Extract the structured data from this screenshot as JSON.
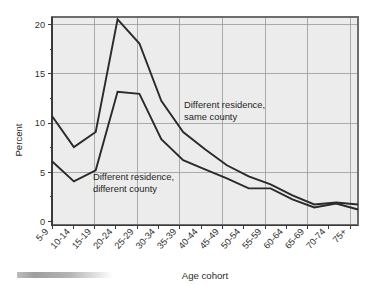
{
  "chart_data": {
    "type": "line",
    "title": "",
    "xlabel": "Age cohort",
    "ylabel": "Percent",
    "ylim": [
      0,
      21.5
    ],
    "yticks": [
      0,
      5,
      10,
      15,
      20
    ],
    "ytick_labels": [
      "0",
      "5",
      "10",
      "15",
      "20"
    ],
    "grid": true,
    "grid_axis": "both",
    "legend_position": "inline-annotations",
    "categories": [
      "5-9",
      "10-14",
      "15-19",
      "20-24",
      "25-29",
      "30-34",
      "35-39",
      "40-44",
      "45-49",
      "50-54",
      "55-59",
      "60-64",
      "65-69",
      "70-74",
      "75+"
    ],
    "series": [
      {
        "name": "Different residence, same county",
        "values": [
          10.9,
          7.8,
          9.3,
          20.5,
          18.1,
          12.4,
          9.3,
          7.6,
          6.0,
          4.9,
          4.1,
          3.0,
          2.1,
          2.3,
          2.1
        ]
      },
      {
        "name": "Different residence, different county",
        "values": [
          6.4,
          4.4,
          5.5,
          13.3,
          13.1,
          8.6,
          6.5,
          5.6,
          4.7,
          3.7,
          3.7,
          2.6,
          1.8,
          2.2,
          1.6
        ]
      }
    ],
    "annotations": [
      {
        "id": "annotation-same-county",
        "line1": "Different residence,",
        "line2": "same county"
      },
      {
        "id": "annotation-different-county",
        "line1": "Different residence,",
        "line2": "different county"
      }
    ],
    "colors": {
      "line": "#2a2a2a",
      "plot_background": "#ececed",
      "grid": "#9a9a9a",
      "frame": "#6d6d6d",
      "page_background": "#ffffff"
    }
  }
}
